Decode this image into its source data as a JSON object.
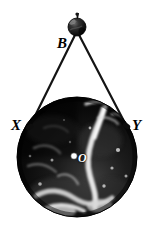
{
  "figure": {
    "type": "geometry-diagram",
    "background_color": "#ffffff",
    "line_color": "#1a1a1a",
    "globe_color": "#0a0a0a",
    "highlight_color": "#ffffff"
  },
  "labels": {
    "satellite": "B",
    "tangent_left": "X",
    "tangent_right": "Y",
    "center": "O"
  },
  "geometry": {
    "satellite_point": {
      "x": 77,
      "y": 27,
      "radius": 9
    },
    "globe": {
      "cx": 77,
      "cy": 157,
      "r": 60
    },
    "tangent_left_point": {
      "x": 29,
      "y": 126
    },
    "tangent_right_point": {
      "x": 126,
      "y": 125
    },
    "center_point": {
      "x": 74,
      "y": 156,
      "radius": 3
    }
  },
  "elements": {
    "satellite_name": "satellite-sphere",
    "globe_name": "earth-globe",
    "left_line_name": "tangent-line-left",
    "right_line_name": "tangent-line-right",
    "center_dot_name": "center-dot"
  }
}
